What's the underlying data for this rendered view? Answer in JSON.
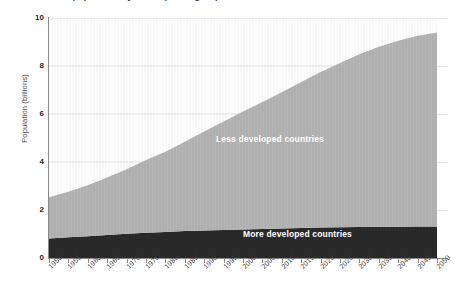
{
  "chart_data": {
    "type": "area",
    "stacked": true,
    "title": "World population by development group",
    "subtitle": "",
    "xlabel": "",
    "ylabel": "Population (billions)",
    "xlim": [
      1950,
      2050
    ],
    "ylim": [
      0,
      10
    ],
    "yticks": [
      0,
      2,
      4,
      6,
      8,
      10
    ],
    "ytick_labels": [
      "0",
      "2",
      "4",
      "6",
      "8",
      "10"
    ],
    "grid": "horizontal",
    "legend_position": "inline-on-areas",
    "x": [
      1950,
      1955,
      1960,
      1965,
      1970,
      1975,
      1980,
      1985,
      1990,
      1995,
      2000,
      2005,
      2010,
      2015,
      2020,
      2025,
      2030,
      2035,
      2040,
      2045,
      2050
    ],
    "xtick_labels": [
      "1950",
      "1955",
      "1960",
      "1965",
      "1970",
      "1975",
      "1980",
      "1985",
      "1990",
      "1995",
      "2000",
      "2005",
      "2010",
      "2015",
      "2020",
      "2025",
      "2030",
      "2035",
      "2040",
      "2045",
      "2050"
    ],
    "series": [
      {
        "name": "More developed countries",
        "color": "#2b2b2b",
        "label_color": "#ffffff",
        "values": [
          0.81,
          0.86,
          0.91,
          0.96,
          1.01,
          1.05,
          1.08,
          1.12,
          1.15,
          1.17,
          1.19,
          1.21,
          1.23,
          1.25,
          1.27,
          1.28,
          1.29,
          1.3,
          1.3,
          1.31,
          1.31
        ]
      },
      {
        "name": "Less developed countries",
        "color": "#b5b5b5",
        "label_color": "#ffffff",
        "values": [
          1.72,
          1.9,
          2.12,
          2.39,
          2.69,
          3.03,
          3.35,
          3.72,
          4.12,
          4.52,
          4.91,
          5.29,
          5.68,
          6.08,
          6.48,
          6.85,
          7.2,
          7.5,
          7.75,
          7.95,
          8.09
        ]
      }
    ],
    "totals": [
      2.53,
      2.76,
      3.03,
      3.35,
      3.7,
      4.08,
      4.43,
      4.84,
      5.27,
      5.69,
      6.1,
      6.5,
      6.91,
      7.33,
      7.75,
      8.13,
      8.49,
      8.8,
      9.05,
      9.26,
      9.4
    ],
    "annotations": [
      {
        "text": "Less developed countries",
        "x": 1985,
        "y": 5.2
      },
      {
        "text": "More developed countries",
        "x": 2005,
        "y": 0.7
      }
    ]
  }
}
